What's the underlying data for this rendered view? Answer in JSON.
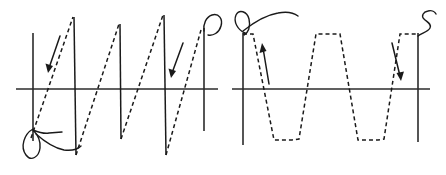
{
  "figure": {
    "title": "",
    "background_color": "#ffffff",
    "stroke_color": "#1a1a1a",
    "axis_color": "#2b2b2b",
    "dash_pattern": "4 3",
    "width": 446,
    "height": 175
  },
  "chart_data": [
    {
      "id": "left-plot",
      "type": "line",
      "title": "",
      "xlabel": "",
      "ylabel": "",
      "waveform": "sawtooth",
      "description": "Sawtooth wave: dashed linear rising ramps with solid vertical falling edges",
      "grid": false,
      "legend": "none",
      "xlim": [
        0,
        4
      ],
      "ylim": [
        -1,
        1
      ],
      "period": 1,
      "amplitude": 1,
      "cycles": 3.5,
      "x": [
        0.0,
        0.25,
        0.5,
        0.75,
        1.0,
        1.25,
        1.5,
        1.75,
        2.0,
        2.25,
        2.5,
        2.75,
        3.0,
        3.25,
        3.5,
        3.75,
        4.0
      ],
      "y": [
        -1.0,
        -0.5,
        0.0,
        0.5,
        1.0,
        -1.0,
        -0.5,
        0.0,
        0.5,
        1.0,
        -1.0,
        -0.5,
        0.0,
        0.5,
        1.0,
        -1.0,
        0.0
      ],
      "axis_x_value": 0,
      "axis_y_start": -1,
      "axis_y_end": 1,
      "annotations": [
        {
          "name": "origin-loop",
          "kind": "hand-drawn-loop",
          "position": "bottom-left"
        },
        {
          "name": "end-hook",
          "kind": "hand-drawn-hook",
          "position": "top-right"
        },
        {
          "name": "slope-arrow-1",
          "kind": "arrow",
          "direction": "down-left",
          "position": "upper-left"
        },
        {
          "name": "slope-arrow-2",
          "kind": "arrow",
          "direction": "down-left",
          "position": "upper-right"
        }
      ]
    },
    {
      "id": "right-plot",
      "type": "line",
      "title": "",
      "xlabel": "",
      "ylabel": "",
      "waveform": "trapezoidal",
      "description": "Clipped triangle / trapezoidal wave: dashed slanted edges with flat crests and troughs",
      "grid": false,
      "legend": "none",
      "xlim": [
        0,
        4
      ],
      "ylim": [
        -1,
        1
      ],
      "period": 1,
      "amplitude": 1,
      "cycles": 3.5,
      "x": [
        0.0,
        0.22,
        0.38,
        0.62,
        0.82,
        1.0,
        1.22,
        1.38,
        1.62,
        1.82,
        2.0,
        2.22,
        2.38,
        2.62,
        2.82,
        3.0,
        3.22,
        3.38,
        3.62,
        3.82,
        4.0
      ],
      "y": [
        1.0,
        -1.0,
        -1.0,
        1.0,
        1.0,
        1.0,
        -1.0,
        -1.0,
        1.0,
        1.0,
        1.0,
        -1.0,
        -1.0,
        1.0,
        1.0,
        1.0,
        -1.0,
        -1.0,
        1.0,
        1.0,
        1.0
      ],
      "axis_x_value": 0,
      "axis_y_start": -1,
      "axis_y_end": 1,
      "annotations": [
        {
          "name": "origin-loop",
          "kind": "hand-drawn-loop",
          "position": "top-left"
        },
        {
          "name": "end-squiggle",
          "kind": "hand-drawn-s-squiggle",
          "position": "top-right"
        },
        {
          "name": "slope-arrow-1",
          "kind": "arrow",
          "direction": "up-right",
          "position": "upper-left"
        },
        {
          "name": "slope-arrow-2",
          "kind": "arrow",
          "direction": "down-right",
          "position": "upper-right"
        }
      ]
    }
  ]
}
